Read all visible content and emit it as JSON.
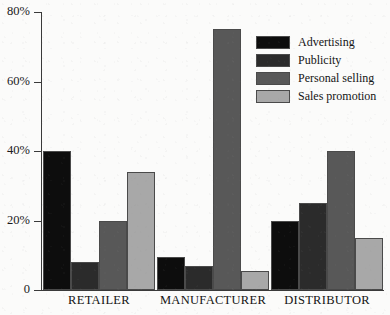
{
  "chart_data": {
    "type": "bar",
    "title": "",
    "xlabel": "",
    "ylabel": "",
    "categories": [
      "RETAILER",
      "MANUFACTURER",
      "DISTRIBUTOR"
    ],
    "series": [
      {
        "name": "Advertising",
        "color": "#0d0d0d",
        "values": [
          40,
          9.5,
          20
        ]
      },
      {
        "name": "Publicity",
        "color": "#2b2b2b",
        "values": [
          8,
          7,
          25
        ]
      },
      {
        "name": "Personal selling",
        "color": "#585858",
        "values": [
          20,
          75,
          40
        ]
      },
      {
        "name": "Sales promotion",
        "color": "#a8a8a8",
        "values": [
          34,
          5.5,
          15
        ]
      }
    ],
    "ylim": [
      0,
      80
    ],
    "yticks": [
      0,
      20,
      40,
      60,
      80
    ],
    "ytick_labels": [
      "0",
      "20%",
      "40%",
      "60%",
      "80%"
    ],
    "grid": false,
    "legend_position": "top-right",
    "value_suffix": "%"
  }
}
